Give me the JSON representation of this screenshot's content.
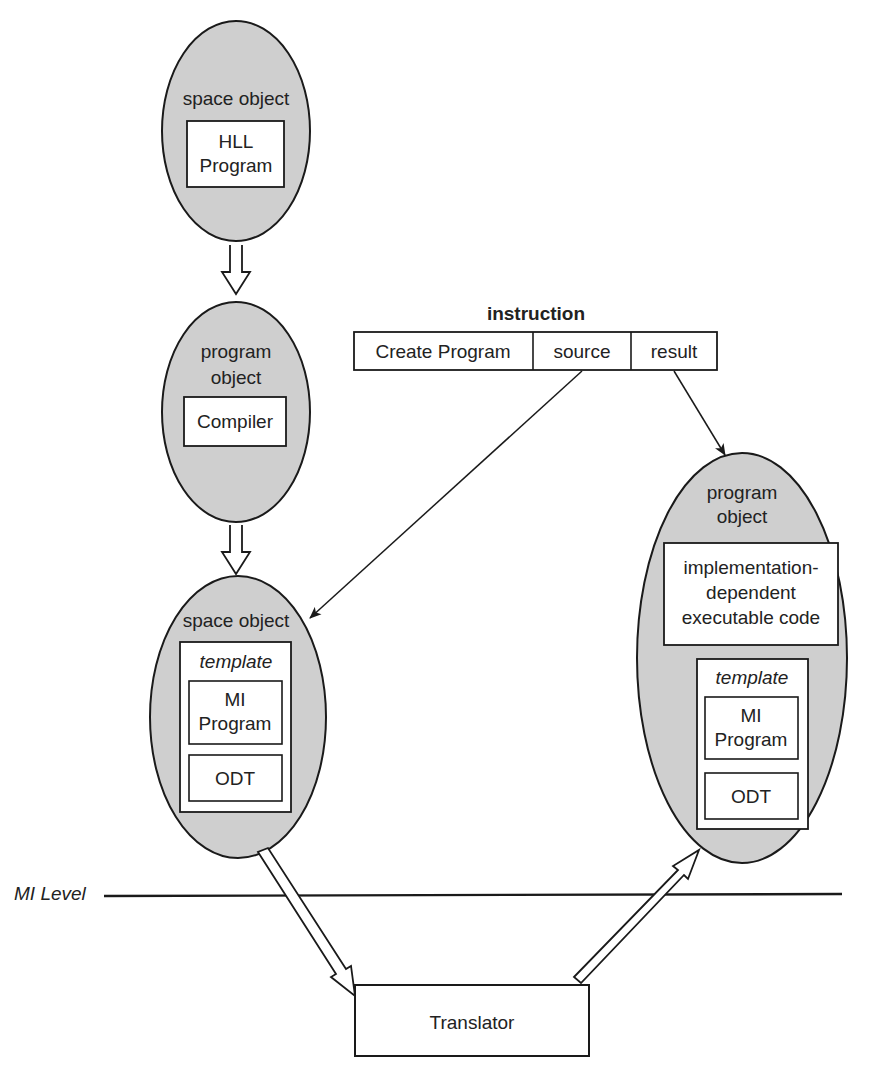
{
  "colors": {
    "ellipse_fill": "#cfcfcf",
    "stroke": "#1a1a1a",
    "box_fill": "#ffffff"
  },
  "top_ellipse": {
    "title": "space object",
    "box_line1": "HLL",
    "box_line2": "Program"
  },
  "middle_ellipse": {
    "title_line1": "program",
    "title_line2": "object",
    "box": "Compiler"
  },
  "bottom_left_ellipse": {
    "title": "space object",
    "template_label": "template",
    "mi_line1": "MI",
    "mi_line2": "Program",
    "odt": "ODT"
  },
  "right_ellipse": {
    "title_line1": "program",
    "title_line2": "object",
    "code_line1": "implementation-",
    "code_line2": "dependent",
    "code_line3": "executable code",
    "template_label": "template",
    "mi_line1": "MI",
    "mi_line2": "Program",
    "odt": "ODT"
  },
  "instruction": {
    "title": "instruction",
    "fields": [
      "Create Program",
      "source",
      "result"
    ]
  },
  "mi_level": {
    "label": "MI Level"
  },
  "translator": {
    "label": "Translator"
  }
}
